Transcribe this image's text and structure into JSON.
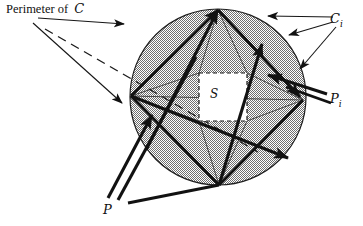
{
  "figure": {
    "kind": "geometry-diagram",
    "canvas": {
      "width": 363,
      "height": 226,
      "background": "#ffffff"
    },
    "labels": {
      "perimeter_text": "Perimeter of",
      "perimeter_symbol": "C",
      "circle_piece_symbol": "C",
      "circle_piece_subscript": "i",
      "path_piece_symbol": "P",
      "path_piece_subscript": "i",
      "path_symbol": "P",
      "inner_region_symbol": "S"
    },
    "colors": {
      "ink": "#121212",
      "shading": "#b9b9b9",
      "shading_light": "#d9d9d9",
      "outline": "#2a2a2a",
      "inner_box_fill": "#ffffff",
      "page": "#ffffff"
    },
    "geometry": {
      "circle": {
        "cx": 218,
        "cy": 97,
        "r": 88
      },
      "vertices": {
        "top": {
          "x": 218,
          "y": 10
        },
        "left": {
          "x": 131,
          "y": 96
        },
        "right": {
          "x": 303,
          "y": 100
        },
        "bottom": {
          "x": 219,
          "y": 185
        }
      },
      "inner_box": {
        "x": 199,
        "y": 73,
        "width": 48,
        "height": 48
      },
      "dashed_line": {
        "x1": 45,
        "y1": 29,
        "x2": 258,
        "y2": 152
      }
    },
    "annotations": [
      {
        "name": "perimeter-arrow",
        "from": [
          38,
          18
        ],
        "to": [
          130,
          25
        ],
        "style": "thin-solid"
      },
      {
        "name": "perimeter-leader",
        "from": [
          33,
          22
        ],
        "to": [
          126,
          104
        ],
        "style": "thin-solid"
      },
      {
        "name": "ci-arrow-top",
        "from": [
          330,
          17
        ],
        "to": [
          262,
          15
        ],
        "style": "thin-solid"
      },
      {
        "name": "ci-arrow-mid",
        "from": [
          331,
          23
        ],
        "to": [
          284,
          36
        ],
        "style": "thin-solid"
      },
      {
        "name": "ci-arrow-low",
        "from": [
          334,
          26
        ],
        "to": [
          296,
          70
        ],
        "style": "thin-solid"
      },
      {
        "name": "pi-line-upper",
        "from": [
          327,
          95
        ],
        "to": [
          272,
          78
        ],
        "style": "thick-solid"
      },
      {
        "name": "pi-line-lower",
        "from": [
          329,
          101
        ],
        "to": [
          283,
          84
        ],
        "style": "thick-solid"
      },
      {
        "name": "p-line-a",
        "from": [
          108,
          198
        ],
        "to": [
          146,
          118
        ],
        "style": "thick-solid"
      },
      {
        "name": "p-line-b",
        "from": [
          118,
          200
        ],
        "to": [
          160,
          110
        ],
        "style": "thick-solid"
      },
      {
        "name": "p-line-c",
        "from": [
          128,
          202
        ],
        "to": [
          170,
          104
        ],
        "style": "thick-solid"
      }
    ]
  }
}
